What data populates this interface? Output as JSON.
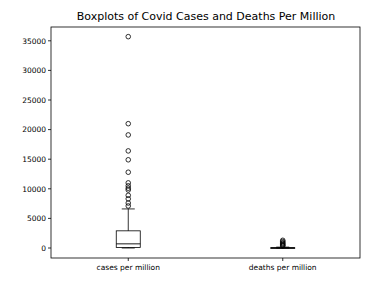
{
  "chart_data": {
    "type": "boxplot",
    "title": "Boxplots of Covid Cases and Deaths Per Million",
    "xlabel": "",
    "ylabel": "",
    "categories": [
      "cases per million",
      "deaths per million"
    ],
    "yticks": [
      0,
      5000,
      10000,
      15000,
      20000,
      25000,
      30000,
      35000
    ],
    "ylim": [
      -1700,
      37000
    ],
    "grid": false,
    "legend": null,
    "series": [
      {
        "name": "cases per million",
        "whisker_low": 0,
        "q1": 100,
        "median": 700,
        "q3": 2900,
        "whisker_high": 6600,
        "outliers": [
          35700,
          21000,
          19100,
          16400,
          14900,
          12800,
          11000,
          10500,
          10100,
          9800,
          8900,
          8300,
          7600,
          7100
        ]
      },
      {
        "name": "deaths per million",
        "whisker_low": 0,
        "q1": 5,
        "median": 20,
        "q3": 60,
        "whisker_high": 150,
        "outliers": [
          1300,
          1100,
          900,
          750,
          600,
          450,
          350
        ]
      }
    ]
  }
}
